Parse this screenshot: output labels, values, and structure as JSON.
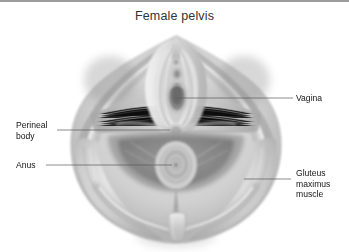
{
  "figure": {
    "title": "Female pelvis",
    "background_color": "#ffffff",
    "border_color": "#9c9c9c",
    "title_color": "#333333",
    "label_color": "#151515",
    "leader_color": "#5a5a5a"
  },
  "labels": {
    "vagina": {
      "text": "Vagina",
      "lines": [
        "Vagina"
      ],
      "side": "right"
    },
    "perineal_body": {
      "text": "Perineal body",
      "lines": [
        "Perineal",
        "body"
      ],
      "side": "left"
    },
    "anus": {
      "text": "Anus",
      "lines": [
        "Anus"
      ],
      "side": "left"
    },
    "gluteus_maximus": {
      "text": "Gluteus maximus muscle",
      "lines": [
        "Gluteus",
        "maximus",
        "muscle"
      ],
      "side": "right"
    }
  },
  "structures": [
    "vagina",
    "perineal body",
    "anus",
    "gluteus maximus muscle"
  ]
}
